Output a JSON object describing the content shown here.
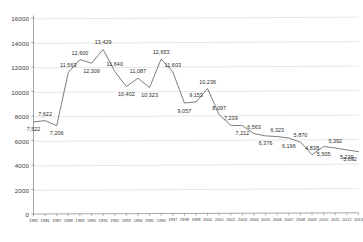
{
  "chart_data": {
    "type": "line",
    "title": "",
    "subtitle": "",
    "xlabel": "",
    "ylabel": "",
    "grid": true,
    "legend": false,
    "legend_position": "none",
    "line_color": "#6e6e6e",
    "grid_color": "#d9d9d9",
    "axis_color": "#808080",
    "label_color": "#2b2b2b",
    "ylim": [
      0,
      16000
    ],
    "ytick_step": 2000,
    "ytick_labels": [
      "0",
      "2000",
      "4000",
      "6000",
      "8000",
      "10000",
      "12000",
      "14000",
      "16000"
    ],
    "ytick_values": [
      0,
      2000,
      4000,
      6000,
      8000,
      10000,
      12000,
      14000,
      16000
    ],
    "categories": [
      "1985",
      "1986",
      "1987",
      "1988",
      "1989",
      "1990",
      "1991",
      "1992",
      "1993",
      "1994",
      "1995",
      "1996",
      "1997",
      "1998",
      "1999",
      "2000",
      "2001",
      "2002",
      "2003",
      "2004",
      "2005",
      "2006",
      "2007",
      "2008",
      "2009",
      "2010",
      "2011",
      "2012",
      "2013"
    ],
    "values": [
      7522,
      7622,
      7206,
      11563,
      12600,
      12309,
      13429,
      11640,
      10402,
      11087,
      10323,
      12653,
      11603,
      9057,
      9153,
      10236,
      8097,
      7239,
      7212,
      6563,
      6376,
      6323,
      6196,
      5870,
      4838,
      5505,
      5392,
      5229,
      5092
    ],
    "point_labels": [
      "7,522",
      "7,622",
      "7,206",
      "11,563",
      "12,600",
      "12,309",
      "13,429",
      "11,640",
      "10,402",
      "11,087",
      "10,323",
      "12,653",
      "11,603",
      "9,057",
      "9,153",
      "10,236",
      "8,097",
      "7,239",
      "7,212",
      "6,563",
      "6,376",
      "6,323",
      "6,196",
      "5,870",
      "4,838",
      "5,505",
      "5,392",
      "5,229",
      "5,092"
    ]
  }
}
